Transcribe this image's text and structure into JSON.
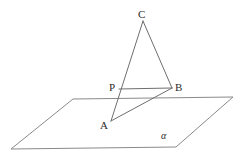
{
  "figure": {
    "kind": "solid-geometry-diagram",
    "stroke_color": "#6e6e6e",
    "plane_stroke_color": "#8a8a8a",
    "label_color": "#2b2b2b",
    "background": "#ffffff",
    "width": 241,
    "height": 156
  },
  "labels": {
    "C": "C",
    "P": "P",
    "B": "B",
    "A": "A",
    "alpha": "α"
  },
  "points": {
    "C": {
      "x": 143,
      "y": 21
    },
    "P": {
      "x": 119,
      "y": 89
    },
    "B": {
      "x": 172,
      "y": 88
    },
    "A": {
      "x": 111,
      "y": 121
    }
  },
  "plane": {
    "name": "alpha",
    "corners": [
      {
        "x": 73,
        "y": 99
      },
      {
        "x": 233,
        "y": 97
      },
      {
        "x": 176,
        "y": 147
      },
      {
        "x": 11,
        "y": 149
      }
    ]
  },
  "segments": [
    {
      "name": "CA",
      "from": "C",
      "to": "A"
    },
    {
      "name": "CB",
      "from": "C",
      "to": "B"
    },
    {
      "name": "PB",
      "from": "P",
      "to": "B"
    },
    {
      "name": "AB",
      "from": "A",
      "to": "B"
    }
  ]
}
